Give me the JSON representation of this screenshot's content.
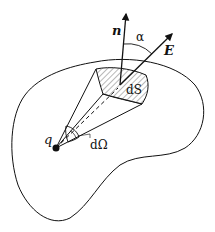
{
  "diagram": {
    "labels": {
      "normal": "n",
      "field": "E",
      "angle": "α",
      "area": "dS",
      "solid_angle": "dΩ",
      "charge": "q"
    },
    "colors": {
      "stroke": "#111111",
      "background": "#ffffff"
    }
  }
}
